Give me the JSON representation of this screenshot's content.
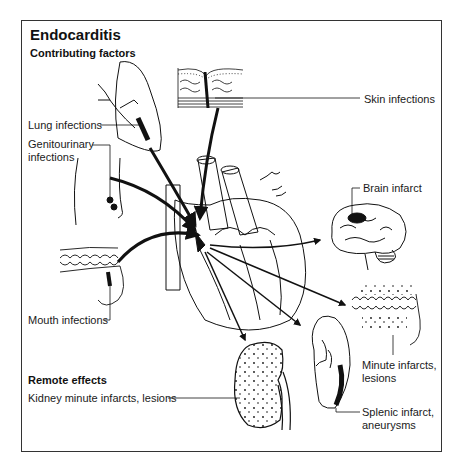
{
  "title": "Endocarditis",
  "sections": {
    "contributing": "Contributing factors",
    "remote": "Remote effects"
  },
  "labels": {
    "skin": "Skin infections",
    "lung": "Lung infections",
    "genitourinary_1": "Genitourinary",
    "genitourinary_2": "infections",
    "mouth": "Mouth infections",
    "brain": "Brain infarct",
    "minute_1": "Minute infarcts,",
    "minute_2": "lesions",
    "splenic_1": "Splenic infarct,",
    "splenic_2": "aneurysms",
    "kidney": "Kidney minute infarcts, lesions"
  },
  "colors": {
    "ink": "#111111",
    "frame": "#333333",
    "background": "#ffffff"
  }
}
